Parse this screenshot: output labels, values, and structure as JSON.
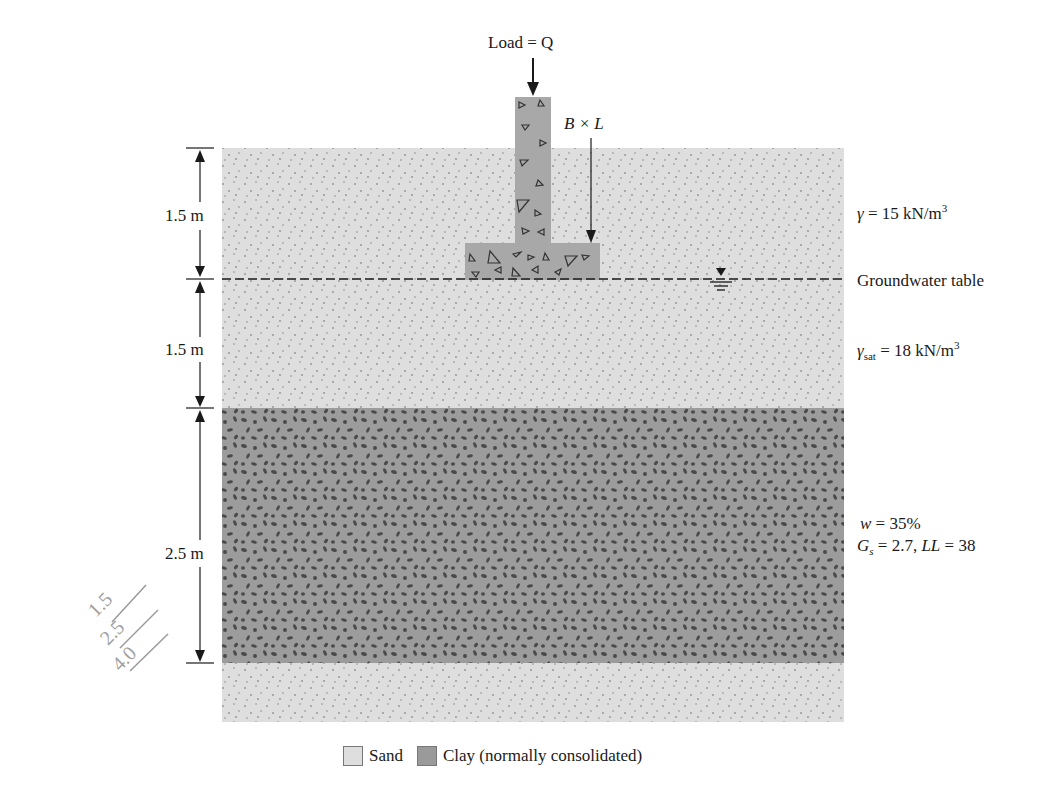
{
  "diagram": {
    "load_label": "Load = Q",
    "footing_label": "B × L",
    "dimensions": [
      {
        "label": "1.5 m",
        "layer": "sand above groundwater"
      },
      {
        "label": "1.5 m",
        "layer": "sand below groundwater"
      },
      {
        "label": "2.5 m",
        "layer": "clay"
      }
    ],
    "properties": {
      "gamma": {
        "symbol": "γ",
        "text": " = 15 kN/m",
        "sup": "3"
      },
      "groundwater": "Groundwater table",
      "gamma_sat": {
        "symbol": "γ",
        "sub": "sat",
        "text": " = 18 kN/m",
        "sup": "3"
      },
      "w": {
        "symbol": "w",
        "text": " = 35%"
      },
      "gs_ll": {
        "gs_symbol": "G",
        "gs_sub": "s",
        "gs_text": " = 2.7, ",
        "ll_symbol": "LL",
        "ll_text": " = 38"
      }
    },
    "handwritten_note": "1.5 / 2.5 / 4.0",
    "legend": [
      {
        "name": "Sand",
        "swatch": "sand"
      },
      {
        "name": "Clay (normally consolidated)",
        "swatch": "clay"
      }
    ],
    "colors": {
      "sand": "#dedede",
      "clay": "#9a9a9a",
      "concrete": "#a8a8a8",
      "line": "#1a1a1a"
    }
  }
}
